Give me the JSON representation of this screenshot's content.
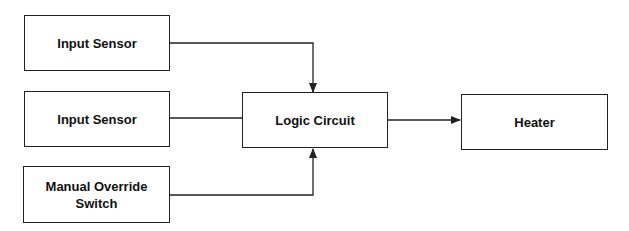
{
  "diagram": {
    "nodes": [
      {
        "id": "input1",
        "label": "Input Sensor"
      },
      {
        "id": "input2",
        "label": "Input Sensor"
      },
      {
        "id": "override",
        "label_line1": "Manual Override",
        "label_line2": "Switch"
      },
      {
        "id": "logic",
        "label": "Logic Circuit"
      },
      {
        "id": "heater",
        "label": "Heater"
      }
    ],
    "edges": [
      {
        "from": "input1",
        "to": "logic",
        "arrow": true
      },
      {
        "from": "input2",
        "to": "logic",
        "arrow": false
      },
      {
        "from": "override",
        "to": "logic",
        "arrow": true
      },
      {
        "from": "logic",
        "to": "heater",
        "arrow": true
      }
    ]
  }
}
